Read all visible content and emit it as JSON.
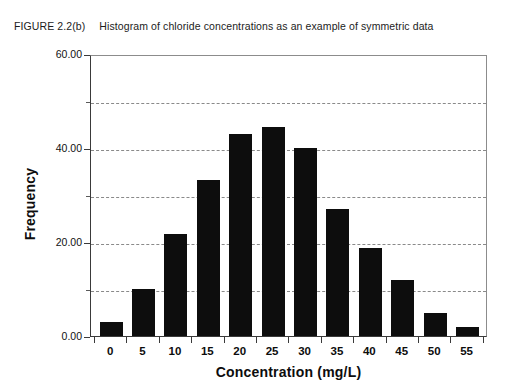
{
  "caption": {
    "figure_number": "FIGURE 2.2(b)",
    "text": "Histogram of chloride concentrations as an example of symmetric data"
  },
  "colors": {
    "bar": "#0d0d0d",
    "axis": "#3a3a3a",
    "grid": "#8a8a8a",
    "background": "#ffffff",
    "text": "#111111"
  },
  "chart_data": {
    "type": "bar",
    "title": "Histogram of chloride concentrations as an example of symmetric data",
    "xlabel": "Concentration (mg/L)",
    "ylabel": "Frequency",
    "categories": [
      "0",
      "5",
      "10",
      "15",
      "20",
      "25",
      "30",
      "35",
      "40",
      "45",
      "50",
      "55"
    ],
    "values": [
      3,
      10,
      21.7,
      33.3,
      43,
      44.5,
      40,
      27,
      18.7,
      12,
      5,
      2
    ],
    "ylim": [
      0,
      60
    ],
    "ytick_labels": [
      "0.00",
      "20.00",
      "40.00",
      "60.00"
    ],
    "ytick_values": [
      0,
      20,
      40,
      60
    ],
    "gridline_values": [
      10,
      20,
      30,
      40,
      50
    ],
    "grid": true,
    "legend": "none"
  }
}
